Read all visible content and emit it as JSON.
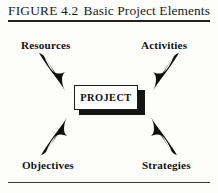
{
  "figure": {
    "caption_label": "FIGURE 4.2",
    "caption_title": "Basic Project Elements",
    "center": {
      "label": "PROJECT"
    },
    "nodes": [
      {
        "id": "resources",
        "label": "Resources",
        "position": "top-left"
      },
      {
        "id": "activities",
        "label": "Activities",
        "position": "top-right"
      },
      {
        "id": "objectives",
        "label": "Objectives",
        "position": "bottom-left"
      },
      {
        "id": "strategies",
        "label": "Strategies",
        "position": "bottom-right"
      }
    ],
    "arrows": [
      {
        "id": "arrow-resources-to-project",
        "from": "Resources",
        "to": "PROJECT",
        "direction": "down-right"
      },
      {
        "id": "arrow-activities-to-project",
        "from": "Activities",
        "to": "PROJECT",
        "direction": "down-left"
      },
      {
        "id": "arrow-objectives-to-project",
        "from": "Objectives",
        "to": "PROJECT",
        "direction": "up-right"
      },
      {
        "id": "arrow-strategies-to-project",
        "from": "Strategies",
        "to": "PROJECT",
        "direction": "up-left"
      }
    ],
    "colors": {
      "ink": "#141414",
      "rule": "#23201f",
      "paper": "#fdfdfc",
      "shadow": "#151515"
    }
  }
}
